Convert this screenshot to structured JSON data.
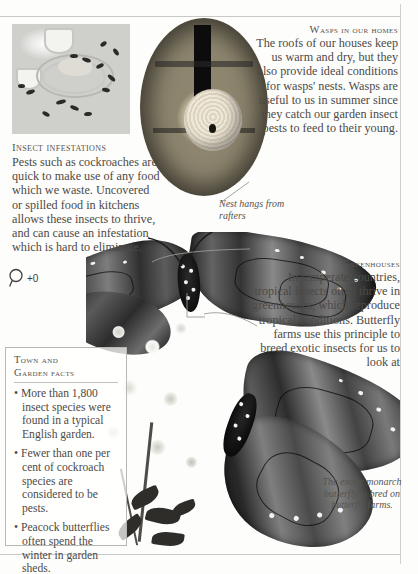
{
  "page": {
    "background_color": "#fdfdfc",
    "text_color": "#4d4a46",
    "rule_color": "#c9c9c9"
  },
  "articles": {
    "insect_infestations": {
      "heading": "Insect infestations",
      "body": "Pests such as cockroaches are quick to make use of any food which we waste. Uncovered or spilled food in kitchens allows these insects to thrive, and can cause an infestation which is hard to eliminate."
    },
    "wasps_in_our_homes": {
      "heading": "Wasps in our homes",
      "body": "The roofs of our houses keep us warm and dry, but they also provide ideal conditions for wasps' nests. Wasps are useful to us in summer since they catch our garden insect pests to feed to their young."
    },
    "greenhouses": {
      "heading": "Greenhouses",
      "body": "In temperate countries, tropical insects often thrive in greenhouses, which reproduce tropical conditions. Butterfly farms use this principle to breed exotic insects for us to  look at"
    }
  },
  "captions": {
    "nest": "Nest hangs from rafters",
    "monarch": "The exotic monarch butterfly is bred on butterfly farms."
  },
  "facts_box": {
    "heading_line1": "Town and",
    "heading_line2": "Garden facts",
    "items": [
      "• More than 1,800 insect species were found in a typical English garden.",
      "• Fewer than one per cent of cockroach species are considered to be pests.",
      "• Peacock butterflies often spend the winter in garden sheds."
    ]
  },
  "images": {
    "food_photo": "kitchen-table-with-leftover-food-and-cockroaches",
    "wasp_photo": "wasp-nest-hanging-from-roof-rafters",
    "butterfly_photo": "two-monarch-butterflies-on-flowers"
  },
  "zoom_widget": {
    "icon": "magnifier-icon",
    "level": "+0"
  }
}
